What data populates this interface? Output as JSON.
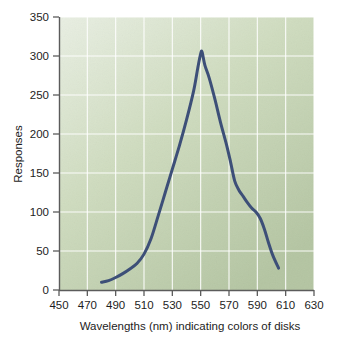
{
  "chart_data": {
    "type": "line",
    "title": "",
    "subtitle": "",
    "xlabel": "Wavelengths (nm) indicating colors of disks",
    "ylabel": "Responses",
    "xlim": [
      450,
      630
    ],
    "ylim": [
      0,
      350
    ],
    "xticks": [
      450,
      470,
      490,
      510,
      530,
      550,
      570,
      590,
      610,
      630
    ],
    "yticks": [
      0,
      50,
      100,
      150,
      200,
      250,
      300,
      350
    ],
    "xtick_labels": [
      "450",
      "470",
      "490",
      "510",
      "530",
      "550",
      "570",
      "590",
      "610",
      "630"
    ],
    "ytick_labels": [
      "0",
      "50",
      "100",
      "150",
      "200",
      "250",
      "300",
      "350"
    ],
    "grid": true,
    "grid_color": "#ffffff",
    "legend": false,
    "legend_position": "none",
    "plot_background_colors": [
      "#e6ecdf",
      "#b6c7a4"
    ],
    "line_color": "#3d4f78",
    "line_width": 3,
    "series": [
      {
        "name": "Responses",
        "x": [
          480,
          485,
          490,
          495,
          500,
          505,
          510,
          515,
          520,
          525,
          530,
          535,
          540,
          545,
          548,
          550,
          551,
          553,
          556,
          560,
          564,
          568,
          571,
          574,
          577,
          580,
          583,
          586,
          589,
          592,
          595,
          598,
          601,
          605
        ],
        "values": [
          10,
          12,
          16,
          21,
          27,
          34,
          46,
          66,
          95,
          125,
          155,
          185,
          218,
          255,
          285,
          303,
          305,
          288,
          272,
          245,
          215,
          188,
          165,
          140,
          128,
          120,
          112,
          105,
          100,
          92,
          78,
          60,
          44,
          28
        ]
      }
    ]
  }
}
